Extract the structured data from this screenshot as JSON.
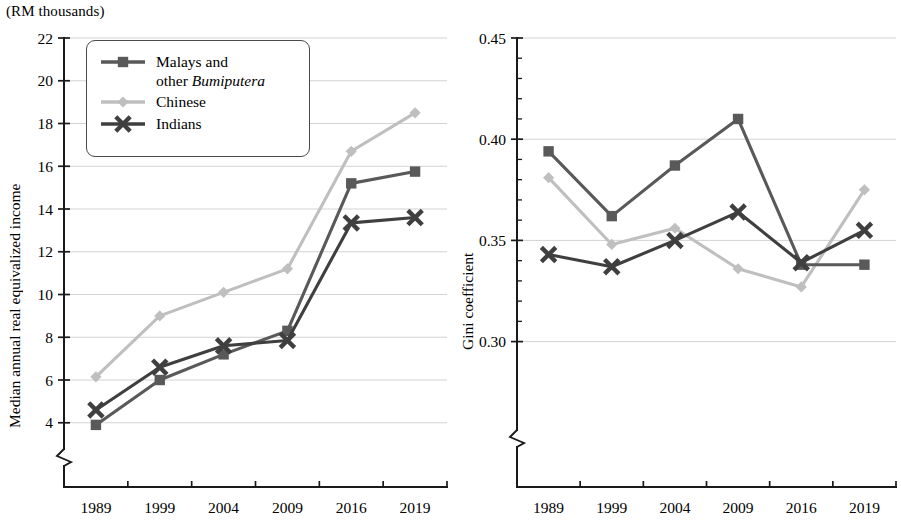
{
  "units_note": "(RM thousands)",
  "legend": {
    "items": [
      {
        "label": "Malays and\nother Bumiputera",
        "italic_part": "Bumiputera",
        "color": "#595959",
        "marker": "square"
      },
      {
        "label": "Chinese",
        "color": "#bfbfbf",
        "marker": "diamond"
      },
      {
        "label": "Indians",
        "color": "#3f3f3f",
        "marker": "x"
      }
    ]
  },
  "chart_data": [
    {
      "id": "income",
      "type": "line",
      "title": "",
      "xlabel": "",
      "ylabel": "Median annual real equivalized income",
      "unit_note": "(RM thousands)",
      "categories": [
        "1989",
        "1999",
        "2004",
        "2009",
        "2016",
        "2019"
      ],
      "ylim": [
        3.1,
        22
      ],
      "yticks": [
        4,
        6,
        8,
        10,
        12,
        14,
        16,
        18,
        20,
        22
      ],
      "ytick_labels": [
        "4",
        "6",
        "8",
        "10",
        "12",
        "14",
        "16",
        "18",
        "20",
        "22"
      ],
      "axis_break": true,
      "grid": true,
      "legend_position": "upper-left",
      "series": [
        {
          "name": "Malays and other Bumiputera",
          "color": "#595959",
          "marker": "square",
          "values": [
            3.9,
            6.0,
            7.2,
            8.3,
            15.2,
            15.75
          ]
        },
        {
          "name": "Chinese",
          "color": "#bfbfbf",
          "marker": "diamond",
          "values": [
            6.15,
            9.0,
            10.1,
            11.2,
            16.7,
            18.5
          ]
        },
        {
          "name": "Indians",
          "color": "#3f3f3f",
          "marker": "x",
          "values": [
            4.6,
            6.6,
            7.6,
            7.85,
            13.35,
            13.6
          ]
        }
      ]
    },
    {
      "id": "gini",
      "type": "line",
      "title": "",
      "xlabel": "",
      "ylabel": "Gini coefficient",
      "categories": [
        "1989",
        "1999",
        "2004",
        "2009",
        "2016",
        "2019"
      ],
      "ylim": [
        0.283,
        0.45
      ],
      "yticks": [
        0.3,
        0.35,
        0.4,
        0.45
      ],
      "ytick_labels": [
        "0.30",
        "0.35",
        "0.40",
        "0.45"
      ],
      "minor_tick_step": 0.01,
      "axis_break": true,
      "grid": true,
      "legend_position": "none",
      "series": [
        {
          "name": "Malays and other Bumiputera",
          "color": "#595959",
          "marker": "square",
          "values": [
            0.394,
            0.362,
            0.387,
            0.41,
            0.338,
            0.338
          ]
        },
        {
          "name": "Chinese",
          "color": "#bfbfbf",
          "marker": "diamond",
          "values": [
            0.381,
            0.348,
            0.356,
            0.336,
            0.327,
            0.375
          ]
        },
        {
          "name": "Indians",
          "color": "#3f3f3f",
          "marker": "x",
          "values": [
            0.343,
            0.337,
            0.35,
            0.364,
            0.339,
            0.355
          ]
        }
      ]
    }
  ]
}
